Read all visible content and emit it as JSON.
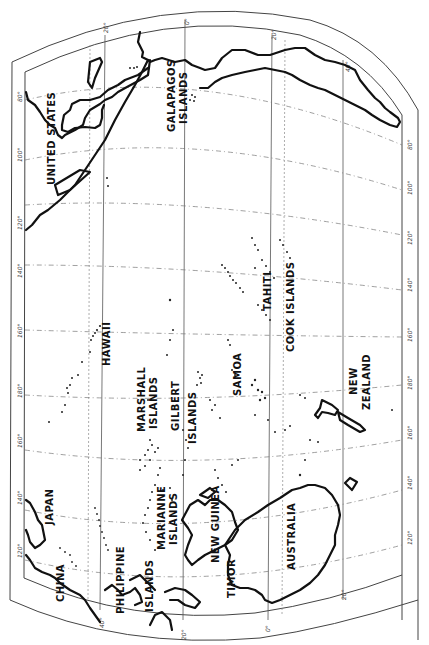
{
  "map": {
    "title": "Pacific Ocean",
    "orientation": "rotated 90 degrees counter-clockwise (north to the left)",
    "labels": {
      "united_states": "UNITED STATES",
      "galapagos_1": "GALAPAGOS",
      "galapagos_2": "ISLANDS",
      "hawaii": "HAWAII",
      "marshall_1": "MARSHALL",
      "marshall_2": "ISLANDS",
      "gilbert_1": "GILBERT",
      "gilbert_2": "ISLANDS",
      "samoa": "SAMOA",
      "tahiti": "TAHITI",
      "cook": "COOK  ISLANDS",
      "new_zealand_1": "NEW",
      "new_zealand_2": "ZEALAND",
      "japan": "JAPAN",
      "china": "CHINA",
      "philippine_1": "PHILIPPINE",
      "philippine_2": "ISLANDS",
      "marianne_1": "MARIANNE",
      "marianne_2": "ISLANDS",
      "new_guinea": "NEW GUINEA",
      "timor": "TIMOR",
      "australia": "AUSTRALIA"
    },
    "longitude_ticks": {
      "left": [
        "80°",
        "100°",
        "120°",
        "140°",
        "160°",
        "180°",
        "160°",
        "140°",
        "120°"
      ],
      "right": [
        "80°",
        "100°",
        "120°",
        "140°",
        "160°",
        "180°",
        "160°",
        "140°",
        "120°"
      ]
    },
    "latitude_ticks": {
      "top": [
        "20°",
        "0°",
        "20°",
        "40°"
      ],
      "bottom": [
        "40°",
        "20°",
        "0°",
        "20°"
      ]
    },
    "colors": {
      "ink": "#111111",
      "paper": "#ffffff",
      "grid": "#555555"
    }
  }
}
